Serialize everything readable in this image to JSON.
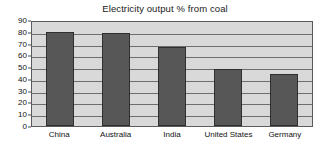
{
  "chart_data": {
    "type": "bar",
    "title": "Electricity output % from coal",
    "xlabel": "",
    "ylabel": "",
    "categories": [
      "China",
      "Australia",
      "India",
      "United States",
      "Germany"
    ],
    "values": [
      80,
      79,
      67,
      48,
      44
    ],
    "ylim": [
      0,
      90
    ],
    "yticks": [
      0,
      10,
      20,
      30,
      40,
      50,
      60,
      70,
      80,
      90
    ],
    "ytick_labels": [
      "0",
      "10",
      "20",
      "30",
      "40",
      "50",
      "60",
      "70",
      "80",
      "90"
    ],
    "grid": true,
    "legend": false,
    "series": [
      {
        "name": "Electricity output % from coal",
        "values": [
          80,
          79,
          67,
          48,
          44
        ]
      }
    ],
    "colors": {
      "bar_fill": "#575757",
      "bar_border": "#2f2f2f",
      "plot_background": "#d9d9d9",
      "gridline": "#6e6e6e",
      "axis_border": "#5a5a5a",
      "text": "#111111",
      "page_background": "#ffffff"
    }
  }
}
